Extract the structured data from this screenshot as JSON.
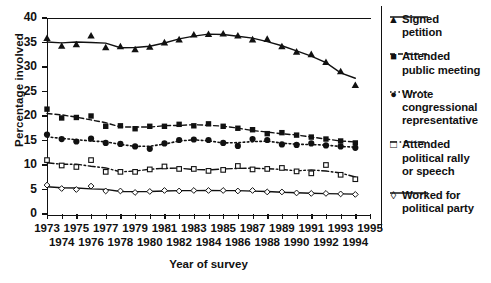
{
  "chart_data": {
    "type": "line",
    "title": "",
    "xlabel": "Year of survey",
    "ylabel": "Percentage involved",
    "ylim": [
      0,
      40
    ],
    "ytick_values": [
      0,
      5,
      10,
      15,
      20,
      25,
      30,
      35,
      40
    ],
    "xlim": [
      1973,
      1995
    ],
    "grid": false,
    "legend_position": "right",
    "x": [
      1973,
      1974,
      1975,
      1976,
      1977,
      1978,
      1979,
      1980,
      1981,
      1982,
      1983,
      1984,
      1985,
      1986,
      1987,
      1988,
      1989,
      1990,
      1991,
      1992,
      1993,
      1994
    ],
    "xtick_labels_top": [
      "1973",
      "1975",
      "1977",
      "1979",
      "1981",
      "1983",
      "1985",
      "1987",
      "1989",
      "1991",
      "1993",
      "1995"
    ],
    "xtick_labels_bottom": [
      "1974",
      "1976",
      "1978",
      "1980",
      "1982",
      "1984",
      "1986",
      "1988",
      "1990",
      "1992",
      "1994"
    ],
    "series": [
      {
        "name": "Signed petition",
        "marker": "filled-triangle",
        "line_style": "solid",
        "values": [
          35.9,
          34.3,
          34.6,
          36.4,
          34.0,
          34.2,
          33.6,
          34.1,
          35.0,
          35.6,
          36.6,
          36.7,
          36.8,
          36.4,
          35.6,
          35.7,
          34.2,
          33.1,
          32.6,
          31.0,
          29.1,
          26.3
        ]
      },
      {
        "name": "Attended public meeting",
        "marker": "filled-square",
        "line_style": "dashed",
        "values": [
          21.4,
          19.6,
          19.7,
          20.0,
          17.9,
          18.0,
          17.4,
          17.9,
          17.9,
          18.3,
          18.0,
          18.4,
          17.9,
          17.5,
          17.2,
          16.4,
          16.6,
          16.1,
          15.7,
          15.3,
          14.9,
          14.5
        ]
      },
      {
        "name": "Wrote congressional representative",
        "marker": "filled-circle",
        "line_style": "dotted",
        "values": [
          16.2,
          15.3,
          14.8,
          15.4,
          14.5,
          14.3,
          13.8,
          13.3,
          14.4,
          15.1,
          15.2,
          15.1,
          14.5,
          13.9,
          15.3,
          15.1,
          14.2,
          14.1,
          14.4,
          14.0,
          13.8,
          13.5
        ]
      },
      {
        "name": "Attended political rally or speech",
        "marker": "open-square",
        "line_style": "dash-dot",
        "values": [
          11.0,
          9.9,
          9.6,
          11.0,
          8.6,
          8.6,
          8.6,
          9.1,
          9.7,
          9.2,
          9.2,
          8.8,
          9.0,
          9.8,
          9.1,
          9.2,
          9.4,
          8.7,
          8.3,
          10.0,
          8.0,
          7.1
        ]
      },
      {
        "name": "Worked for political party",
        "marker": "open-diamond",
        "line_style": "solid",
        "values": [
          5.9,
          5.2,
          5.0,
          5.7,
          4.7,
          4.7,
          4.4,
          4.6,
          4.8,
          4.7,
          4.8,
          4.8,
          4.8,
          4.7,
          4.8,
          4.5,
          4.5,
          4.3,
          4.2,
          4.2,
          4.1,
          4.0
        ]
      }
    ]
  },
  "legend": {
    "items": [
      {
        "marker_glyph": "▲",
        "label_line1": "Signed",
        "label_line2": "petition",
        "label_line3": "",
        "line_style": "solid"
      },
      {
        "marker_glyph": "■",
        "label_line1": "Attended",
        "label_line2": "public meeting",
        "label_line3": "",
        "line_style": "dashed"
      },
      {
        "marker_glyph": "●",
        "label_line1": "Wrote",
        "label_line2": "congressional",
        "label_line3": "representative",
        "line_style": "dotted"
      },
      {
        "marker_glyph": "□",
        "label_line1": "Attended",
        "label_line2": "political rally",
        "label_line3": "or speech",
        "line_style": "dash-dot"
      },
      {
        "marker_glyph": "◊",
        "label_line1": "Worked for",
        "label_line2": "political party",
        "label_line3": "",
        "line_style": "solid"
      }
    ]
  },
  "colors": {
    "ink": "#111111",
    "background": "#ffffff"
  }
}
